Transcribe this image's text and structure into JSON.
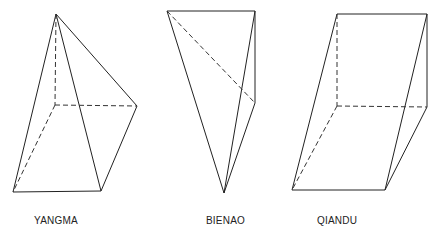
{
  "figures": [
    {
      "label": "YANGMA",
      "label_x": 34,
      "vertices": {
        "apex": [
          56,
          14
        ],
        "back_left": [
          55,
          105
        ],
        "right": [
          137,
          106
        ],
        "bottom_left": [
          13,
          192
        ],
        "bottom_right": [
          101,
          191
        ]
      }
    },
    {
      "label": "BIENAO",
      "label_x": 206,
      "vertices": {
        "top_left": [
          167,
          11
        ],
        "top_right": [
          255,
          11
        ],
        "right_mid": [
          255,
          103
        ],
        "bottom": [
          224,
          193
        ]
      }
    },
    {
      "label": "QIANDU",
      "label_x": 317,
      "vertices": {
        "top_left": [
          337,
          14
        ],
        "top_right": [
          427,
          14
        ],
        "back_bottom_left": [
          337,
          106
        ],
        "back_bottom_right": [
          427,
          107
        ],
        "front_bottom_left": [
          292,
          190
        ],
        "front_bottom_right": [
          385,
          190
        ]
      }
    }
  ],
  "colors": {
    "line": "#222222",
    "background": "#ffffff"
  }
}
